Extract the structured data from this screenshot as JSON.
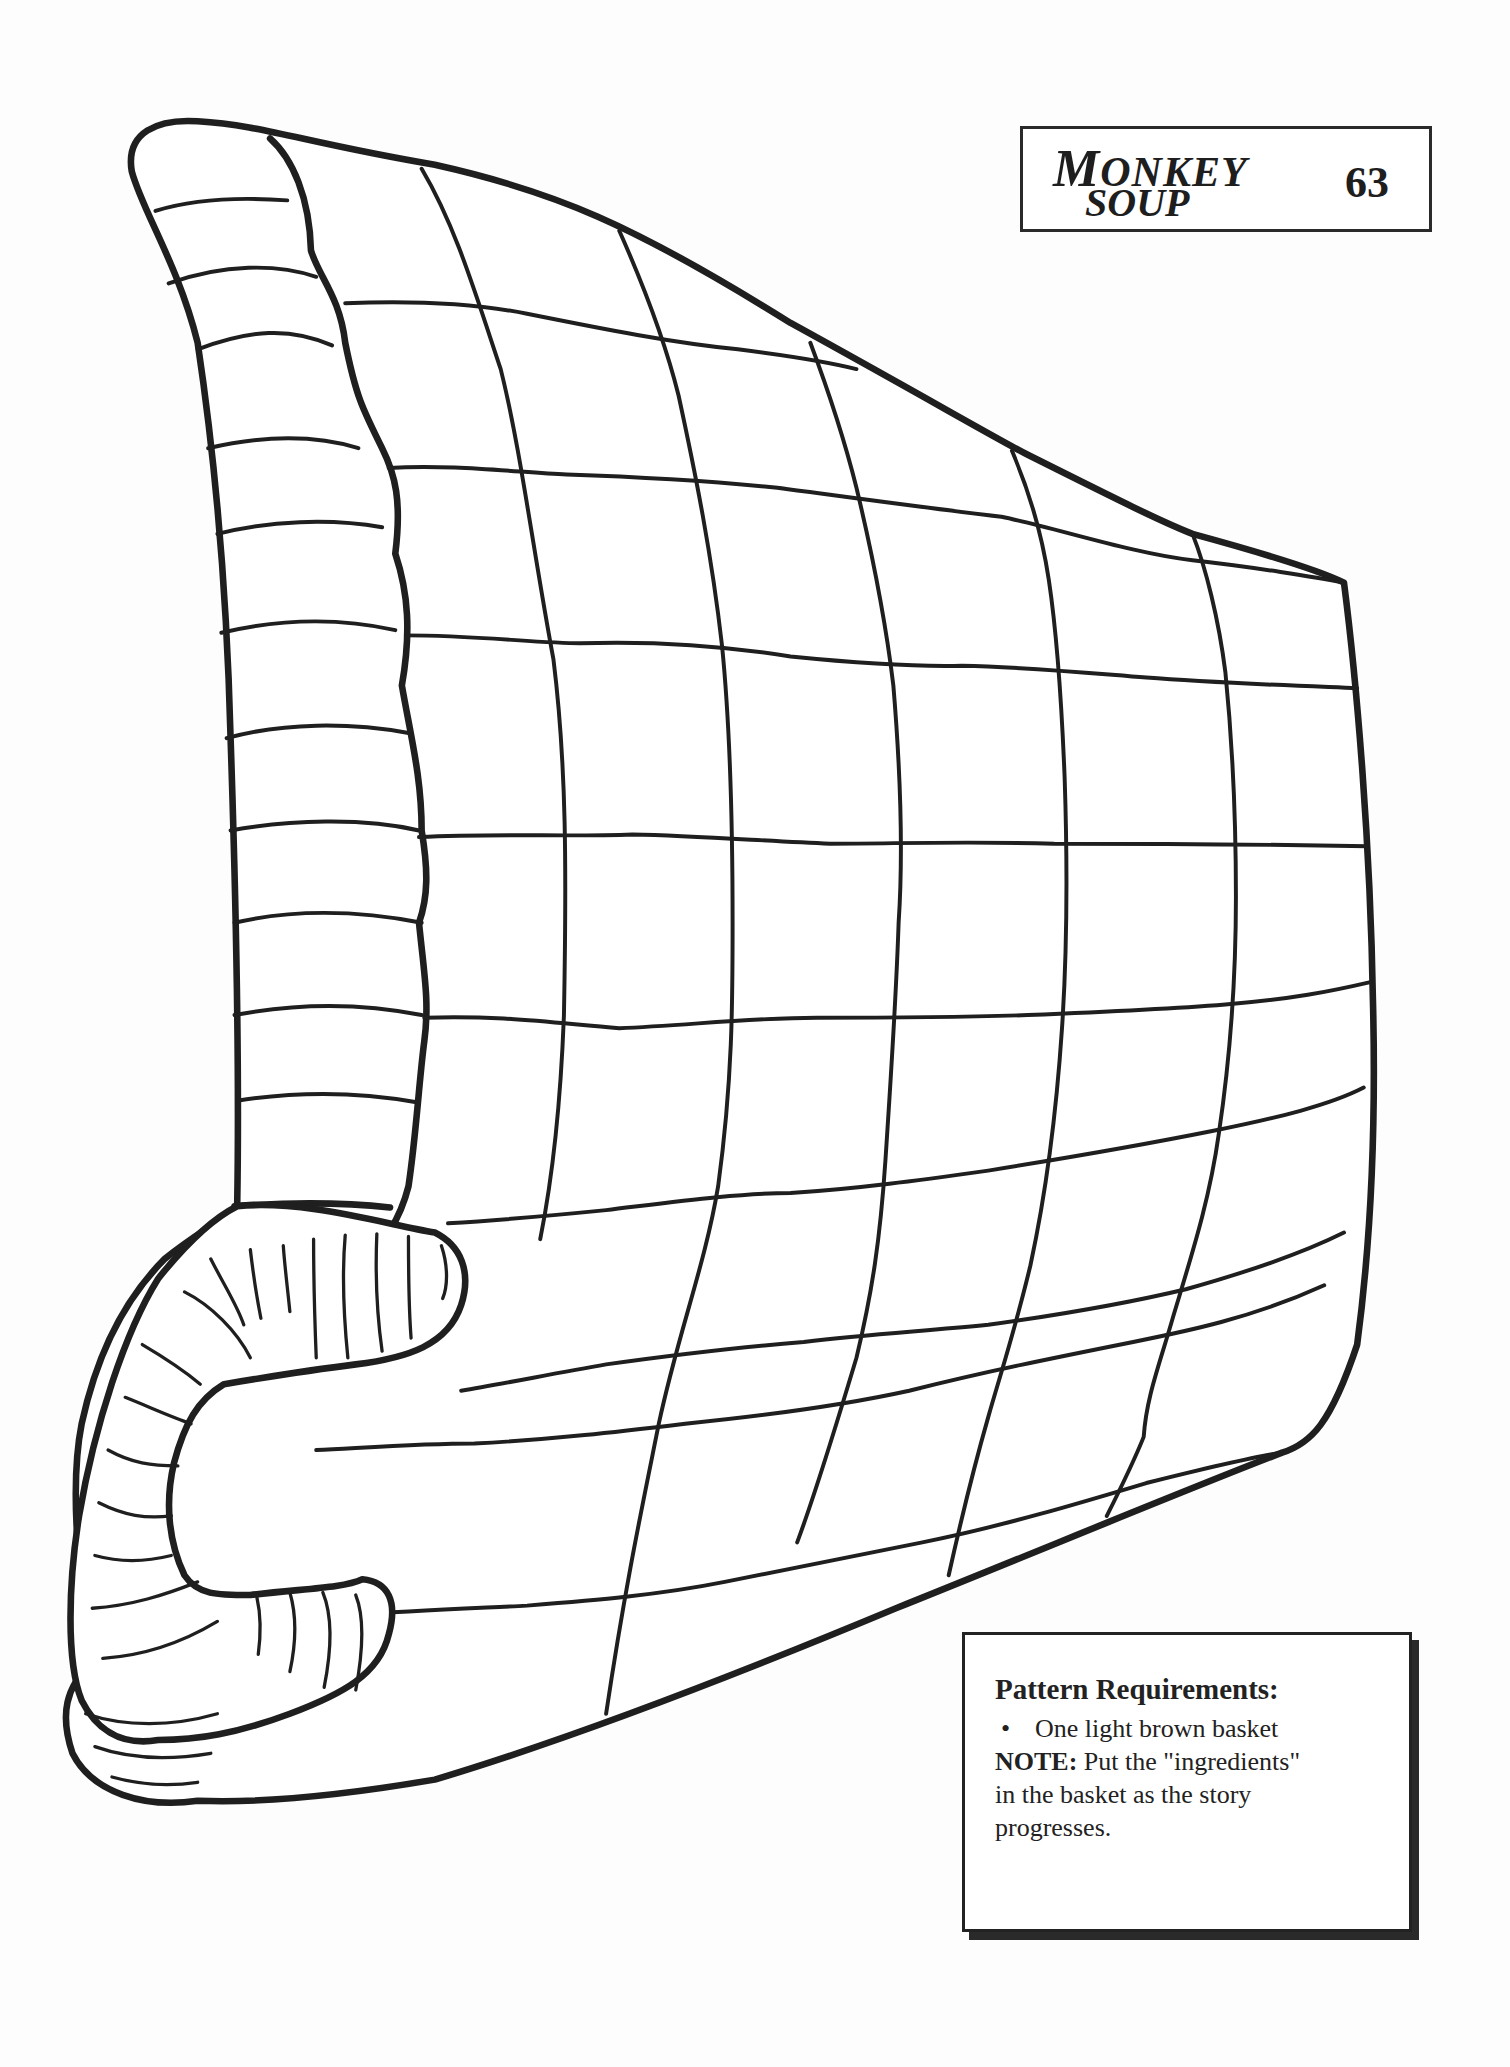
{
  "header": {
    "title_line1_initial": "M",
    "title_line1_rest": "ONKEY",
    "title_line2": "SOUP",
    "page_number": "63"
  },
  "requirements": {
    "title": "Pattern Requirements:",
    "items": [
      {
        "bullet": "•",
        "text": "One light brown basket"
      }
    ],
    "note_label": "NOTE:",
    "note_text_line1": " Put the \"ingredients\"",
    "note_text_line2": "in the basket as the story",
    "note_text_line3": "progresses."
  },
  "illustration": {
    "subject": "basket-outline",
    "stroke_color": "#1f1f1f",
    "fill_color": "#ffffff"
  }
}
